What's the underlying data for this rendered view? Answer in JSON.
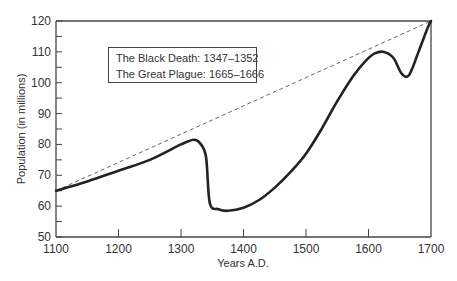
{
  "chart_data": {
    "type": "line",
    "title": "",
    "xlabel": "Years A.D.",
    "ylabel": "Population (in millions)",
    "xlim": [
      1100,
      1700
    ],
    "ylim": [
      50,
      120
    ],
    "x_ticks": [
      1100,
      1200,
      1300,
      1400,
      1500,
      1600,
      1700
    ],
    "y_ticks": [
      50,
      60,
      70,
      80,
      90,
      100,
      110,
      120
    ],
    "grid": false,
    "series": [
      {
        "name": "Population",
        "style": "solid",
        "x": [
          1100,
          1150,
          1200,
          1250,
          1300,
          1320,
          1330,
          1340,
          1346,
          1360,
          1375,
          1400,
          1425,
          1450,
          1475,
          1500,
          1525,
          1550,
          1575,
          1595,
          1610,
          1625,
          1640,
          1653,
          1665,
          1680,
          1695,
          1700
        ],
        "values": [
          65,
          68,
          71.5,
          75,
          80,
          81.5,
          80.5,
          76,
          61,
          59,
          58.5,
          59.5,
          62,
          66,
          71,
          77,
          85,
          94,
          102,
          107,
          109.5,
          110,
          108,
          103,
          102.5,
          110,
          118,
          120
        ]
      },
      {
        "name": "Trend (projected)",
        "style": "dashed",
        "x": [
          1100,
          1700
        ],
        "values": [
          65,
          120
        ]
      }
    ],
    "annotations": [
      "The Black Death: 1347–1352",
      "The Great Plague: 1665–1666"
    ]
  },
  "legend": {
    "line1": "The Black Death: 1347–1352",
    "line2": "The Great Plague: 1665–1666"
  },
  "axes": {
    "xlabel": "Years A.D.",
    "ylabel": "Population (in millions)",
    "x_tick_labels": [
      "1100",
      "1200",
      "1300",
      "1400",
      "1500",
      "1600",
      "1700"
    ],
    "y_tick_labels": [
      "50",
      "60",
      "70",
      "80",
      "90",
      "100",
      "110",
      "120"
    ]
  }
}
